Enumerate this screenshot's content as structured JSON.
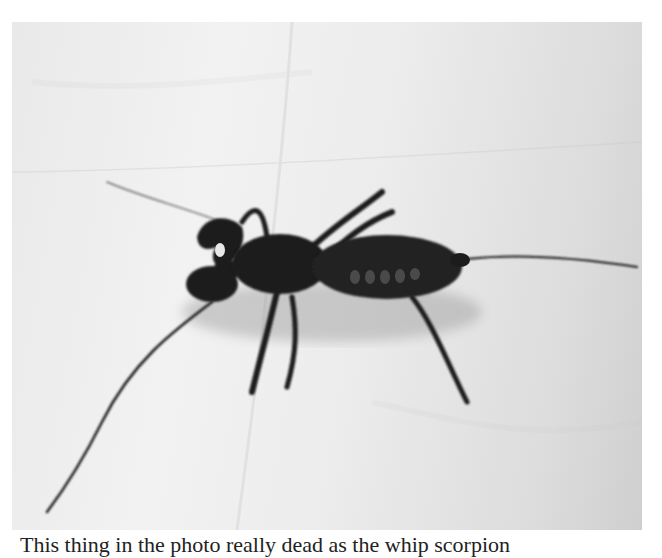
{
  "figure": {
    "style": "grayscale photograph",
    "colors": {
      "background": "#ececec",
      "creature": "#1c1c1c",
      "shadow": "#9a9a9a"
    }
  },
  "caption": {
    "text": "This thing in the photo really dead as the whip scorpion"
  }
}
